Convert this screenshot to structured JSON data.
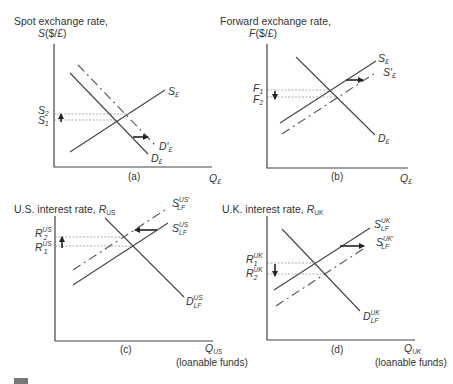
{
  "panels": {
    "a": {
      "ylabel_line1": "Spot exchange rate,",
      "ylabel_var": "S",
      "ylabel_unit": "($/£)",
      "xlabel_var": "Q",
      "xlabel_sub": "£",
      "caption": "(a)",
      "supply_label": "S",
      "supply_sub": "£",
      "demand_label": "D",
      "demand_sub": "£",
      "demand_new_label": "D′",
      "demand_new_sub": "£",
      "level_high": "S",
      "level_high_sub": "2",
      "level_low": "S",
      "level_low_sub": "1",
      "shift_direction": "right",
      "price_change": "up"
    },
    "b": {
      "ylabel_line1": "Forward exchange rate,",
      "ylabel_var": "F",
      "ylabel_unit": "($/£)",
      "xlabel_var": "Q",
      "xlabel_sub": "£",
      "caption": "(b)",
      "supply_label": "S",
      "supply_sub": "£",
      "supply_new_label": "S′",
      "supply_new_sub": "£",
      "demand_label": "D",
      "demand_sub": "£",
      "level_high": "F",
      "level_high_sub": "1",
      "level_low": "F",
      "level_low_sub": "2",
      "shift_direction": "right",
      "price_change": "down"
    },
    "c": {
      "ylabel_line1": "U.S. interest rate, ",
      "ylabel_var": "R",
      "ylabel_sub": "US",
      "xlabel_var": "Q",
      "xlabel_sub": "US",
      "xlabel_note": "(loanable funds)",
      "caption": "(c)",
      "supply_label": "S",
      "supply_sup": "US",
      "supply_sub": "LF",
      "supply_new_label": "S",
      "supply_new_sup": "US′",
      "supply_new_sub": "LF",
      "demand_label": "D",
      "demand_sup": "US",
      "demand_sub": "LF",
      "level_high": "R",
      "level_high_sup": "US",
      "level_high_sub": "2",
      "level_low": "R",
      "level_low_sup": "US",
      "level_low_sub": "1",
      "shift_direction": "left",
      "price_change": "up"
    },
    "d": {
      "ylabel_line1": "U.K. interest rate, ",
      "ylabel_var": "R",
      "ylabel_sub": "UK",
      "xlabel_var": "Q",
      "xlabel_sub": "UK",
      "xlabel_note": "(loanable funds)",
      "caption": "(d)",
      "supply_label": "S",
      "supply_sup": "UK",
      "supply_sub": "LF",
      "supply_new_label": "S",
      "supply_new_sup": "UK′",
      "supply_new_sub": "LF",
      "demand_label": "D",
      "demand_sup": "UK",
      "demand_sub": "LF",
      "level_high": "R",
      "level_high_sup": "UK",
      "level_high_sub": "1",
      "level_low": "R",
      "level_low_sup": "UK",
      "level_low_sub": "2",
      "shift_direction": "right",
      "price_change": "down"
    }
  }
}
